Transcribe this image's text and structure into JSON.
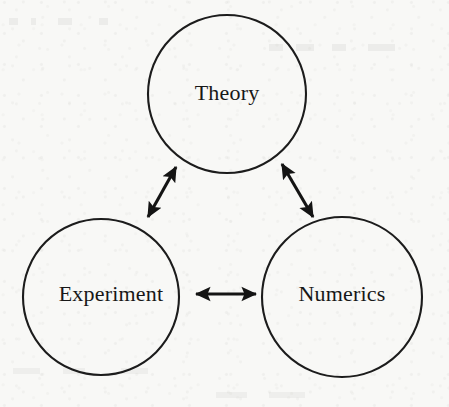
{
  "figure": {
    "background_color": "#f8f8f6",
    "ink_color": "#1c1c1c",
    "width": 449,
    "height": 407
  },
  "nodes": [
    {
      "id": "theory",
      "label": "Theory",
      "cx": 227,
      "cy": 94,
      "r": 79,
      "label_x": 227,
      "label_y": 95
    },
    {
      "id": "experiment",
      "label": "Experiment",
      "cx": 101,
      "cy": 297,
      "r": 78,
      "label_x": 111,
      "label_y": 296
    },
    {
      "id": "numerics",
      "label": "Numerics",
      "cx": 342,
      "cy": 297,
      "r": 80,
      "label_x": 342,
      "label_y": 296
    }
  ],
  "links": [
    {
      "id": "theory-experiment",
      "from": "theory",
      "to": "experiment",
      "arrowheads": "both",
      "x1": 176,
      "y1": 167,
      "x2": 148,
      "y2": 217
    },
    {
      "id": "theory-numerics",
      "from": "theory",
      "to": "numerics",
      "arrowheads": "both",
      "x1": 282,
      "y1": 164,
      "x2": 313,
      "y2": 217
    },
    {
      "id": "experiment-numerics",
      "from": "experiment",
      "to": "numerics",
      "arrowheads": "both",
      "x1": 196,
      "y1": 294,
      "x2": 256,
      "y2": 294
    }
  ]
}
